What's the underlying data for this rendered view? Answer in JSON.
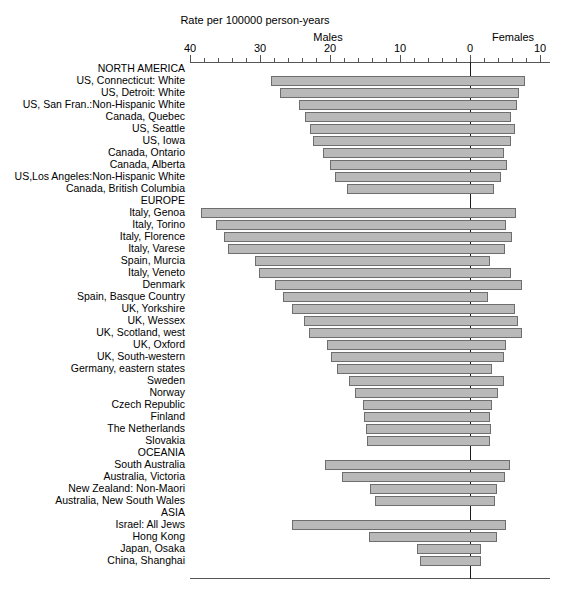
{
  "chart_data": {
    "type": "bar",
    "orientation": "horizontal-diverging",
    "title": "Rate per 100000 person-years",
    "left_group_label": "Males",
    "right_group_label": "Females",
    "xlabel": "",
    "ylabel": "",
    "grid": false,
    "legend": "none",
    "axis": {
      "left_max": 40,
      "right_max": 10,
      "zero_at": 0,
      "major_ticks_left": [
        40,
        30,
        20,
        10,
        0
      ],
      "major_ticks_right": [
        10
      ],
      "tick_labels": [
        "40",
        "30",
        "20",
        "10",
        "0",
        "10"
      ],
      "minor_tick_step": 2
    },
    "series": [
      {
        "name": "Males",
        "side": "left"
      },
      {
        "name": "Females",
        "side": "right"
      }
    ],
    "categories": [
      "NORTH AMERICA",
      "US, Connecticut: White",
      "US, Detroit: White",
      "US, San Fran.:Non-Hispanic White",
      "Canada, Quebec",
      "US, Seattle",
      "US, Iowa",
      "Canada, Ontario",
      "Canada, Alberta",
      "US,Los Angeles:Non-Hispanic White",
      "Canada, British Columbia",
      "EUROPE",
      "Italy, Genoa",
      "Italy, Torino",
      "Italy, Florence",
      "Italy, Varese",
      "Spain, Murcia",
      "Italy, Veneto",
      "Denmark",
      "Spain, Basque Country",
      "UK, Yorkshire",
      "UK, Wessex",
      "UK, Scotland, west",
      "UK, Oxford",
      "UK, South-western",
      "Germany, eastern states",
      "Sweden",
      "Norway",
      "Czech Republic",
      "Finland",
      "The Netherlands",
      "Slovakia",
      "OCEANIA",
      "South Australia",
      "Australia, Victoria",
      "New Zealand: Non-Maori",
      "Australia, New South Wales",
      "ASIA",
      "Israel: All Jews",
      "Hong Kong",
      "Japan, Osaka",
      "China, Shanghai"
    ],
    "rows": [
      {
        "label": "NORTH AMERICA",
        "section": true,
        "males": null,
        "females": null
      },
      {
        "label": "US, Connecticut: White",
        "section": false,
        "males": 28.4,
        "females": 7.9
      },
      {
        "label": "US, Detroit: White",
        "section": false,
        "males": 27.1,
        "females": 7.0
      },
      {
        "label": "US, San Fran.:Non-Hispanic White",
        "section": false,
        "males": 24.4,
        "females": 6.7
      },
      {
        "label": "Canada, Quebec",
        "section": false,
        "males": 23.6,
        "females": 5.9
      },
      {
        "label": "US, Seattle",
        "section": false,
        "males": 22.9,
        "females": 6.4
      },
      {
        "label": "US, Iowa",
        "section": false,
        "males": 22.4,
        "females": 5.9
      },
      {
        "label": "Canada, Ontario",
        "section": false,
        "males": 21.0,
        "females": 4.9
      },
      {
        "label": "Canada, Alberta",
        "section": false,
        "males": 20.0,
        "females": 5.3
      },
      {
        "label": "US,Los Angeles:Non-Hispanic White",
        "section": false,
        "males": 19.3,
        "females": 4.4
      },
      {
        "label": "Canada, British Columbia",
        "section": false,
        "males": 17.6,
        "females": 3.4
      },
      {
        "label": "EUROPE",
        "section": true,
        "males": null,
        "females": null
      },
      {
        "label": "Italy, Genoa",
        "section": false,
        "males": 38.4,
        "females": 6.6
      },
      {
        "label": "Italy, Torino",
        "section": false,
        "males": 36.3,
        "females": 5.1
      },
      {
        "label": "Italy, Florence",
        "section": false,
        "males": 35.1,
        "females": 6.0
      },
      {
        "label": "Italy, Varese",
        "section": false,
        "males": 34.6,
        "females": 5.0
      },
      {
        "label": "Spain, Murcia",
        "section": false,
        "males": 30.7,
        "females": 2.9
      },
      {
        "label": "Italy, Veneto",
        "section": false,
        "males": 30.1,
        "females": 5.9
      },
      {
        "label": "Denmark",
        "section": false,
        "males": 27.9,
        "females": 7.4
      },
      {
        "label": "Spain, Basque Country",
        "section": false,
        "males": 26.7,
        "females": 2.6
      },
      {
        "label": "UK, Yorkshire",
        "section": false,
        "males": 25.4,
        "females": 6.4
      },
      {
        "label": "UK, Wessex",
        "section": false,
        "males": 23.7,
        "females": 6.9
      },
      {
        "label": "UK, Scotland, west",
        "section": false,
        "males": 23.0,
        "females": 7.4
      },
      {
        "label": "UK, Oxford",
        "section": false,
        "males": 20.4,
        "females": 5.1
      },
      {
        "label": "UK, South-western",
        "section": false,
        "males": 19.9,
        "females": 4.9
      },
      {
        "label": "Germany, eastern states",
        "section": false,
        "males": 19.0,
        "females": 3.1
      },
      {
        "label": "Sweden",
        "section": false,
        "males": 17.3,
        "females": 4.9
      },
      {
        "label": "Norway",
        "section": false,
        "males": 16.4,
        "females": 4.0
      },
      {
        "label": "Czech Republic",
        "section": false,
        "males": 15.3,
        "females": 3.1
      },
      {
        "label": "Finland",
        "section": false,
        "males": 15.1,
        "females": 2.9
      },
      {
        "label": "The Netherlands",
        "section": false,
        "males": 14.9,
        "females": 3.0
      },
      {
        "label": "Slovakia",
        "section": false,
        "males": 14.7,
        "females": 2.9
      },
      {
        "label": "OCEANIA",
        "section": true,
        "males": null,
        "females": null
      },
      {
        "label": "South Australia",
        "section": false,
        "males": 20.7,
        "females": 5.7
      },
      {
        "label": "Australia, Victoria",
        "section": false,
        "males": 18.3,
        "females": 5.0
      },
      {
        "label": "New Zealand: Non-Maori",
        "section": false,
        "males": 14.3,
        "females": 3.9
      },
      {
        "label": "Australia, New South Wales",
        "section": false,
        "males": 13.6,
        "females": 3.6
      },
      {
        "label": "ASIA",
        "section": true,
        "males": null,
        "females": null
      },
      {
        "label": "Israel: All Jews",
        "section": false,
        "males": 25.4,
        "females": 5.1
      },
      {
        "label": "Hong Kong",
        "section": false,
        "males": 14.4,
        "females": 3.9
      },
      {
        "label": "Japan, Osaka",
        "section": false,
        "males": 7.6,
        "females": 1.6
      },
      {
        "label": "China, Shanghai",
        "section": false,
        "males": 7.1,
        "females": 1.6
      }
    ]
  }
}
